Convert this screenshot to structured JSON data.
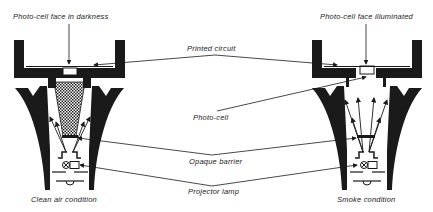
{
  "diagram": {
    "labels": {
      "top_left": "Photo-cell face in darkness",
      "top_right": "Photo-cell face illuminated",
      "printed_circuit": "Printed circuit",
      "photo_cell": "Photo-cell",
      "opaque_barrier": "Opaque barrier",
      "projector_lamp": "Projector lamp",
      "bottom_left": "Clean air condition",
      "bottom_right": "Smoke condition"
    },
    "colors": {
      "ink": "#1a1a1a",
      "paper": "#ffffff"
    },
    "panels": [
      {
        "name": "clean-air",
        "state": "Clean air condition"
      },
      {
        "name": "smoke",
        "state": "Smoke condition"
      }
    ]
  }
}
